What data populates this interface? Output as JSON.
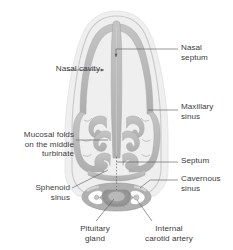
{
  "figure": {
    "colors": {
      "background": "#ffffff",
      "tissue": "#b6b6b6",
      "tissue_light": "#cccccc",
      "tissue_dark": "#9a9a9a",
      "halo": "#ededed",
      "cavity": "#ffffff",
      "outline": "#a8a8a8",
      "leader_line": "#555555",
      "text": "#3c3c3c"
    }
  },
  "labels": {
    "nasal_cavity": "Nasal cavity",
    "nasal_septum": "Nasal\nseptum",
    "maxillary_sinus": "Maxillary\nsinus",
    "mucosal_folds": "Mucosal folds\non the middle\nturbinate",
    "septum": "Septum",
    "cavernous_sinus": "Cavernous\nsinus",
    "sphenoid_sinus": "Sphenoid\nsinus",
    "pituitary_gland": "Pituitary\ngland",
    "internal_carotid_artery": "Internal\ncarotid artery"
  }
}
